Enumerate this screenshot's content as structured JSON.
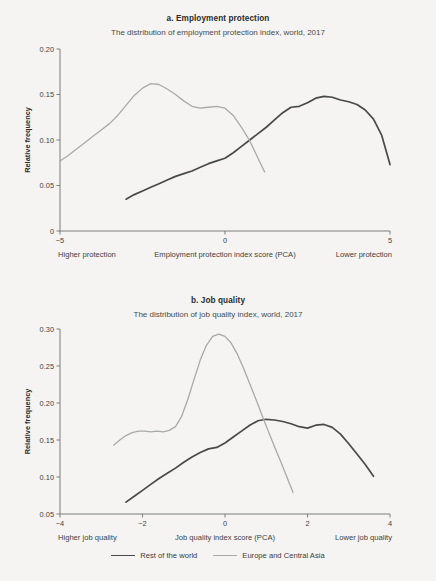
{
  "figure": {
    "background_color": "#f5f4f2",
    "series_colors": {
      "rest_of_the_world": "#494949",
      "europe_and_central_asia": "#a9a9a9"
    }
  },
  "legend": {
    "position": "bottom-center",
    "items": [
      {
        "label": "Rest of the world",
        "color": "#494949",
        "key": "rest_of_the_world"
      },
      {
        "label": "Europe and Central Asia",
        "color": "#a9a9a9",
        "key": "europe_and_central_asia"
      }
    ]
  },
  "chart_data": [
    {
      "id": "panel-a",
      "type": "line",
      "title": "a. Employment protection",
      "subtitle": "The distribution of employment protection index, world, 2017",
      "xlabel": "Employment protection index score (PCA)",
      "ylabel": "Relative frequency",
      "xlim": [
        -5,
        5
      ],
      "ylim": [
        0,
        0.2
      ],
      "xticks": [
        -5,
        0,
        5
      ],
      "xtick_labels": [
        "−5",
        "0",
        "5"
      ],
      "yticks": [
        0,
        0.05,
        0.1,
        0.15,
        0.2
      ],
      "ytick_labels": [
        "0",
        "0.05",
        "0.10",
        "0.15",
        "0.20"
      ],
      "grid": false,
      "left_note": "Higher protection",
      "right_note": "Lower protection",
      "series": [
        {
          "name": "Rest of the world",
          "color": "#494949",
          "x": [
            -3.0,
            -2.75,
            -2.5,
            -2.25,
            -2.0,
            -1.75,
            -1.5,
            -1.25,
            -1.0,
            -0.75,
            -0.5,
            -0.25,
            0.0,
            0.25,
            0.5,
            0.75,
            1.0,
            1.25,
            1.5,
            1.75,
            2.0,
            2.25,
            2.5,
            2.75,
            3.0,
            3.25,
            3.5,
            3.75,
            4.0,
            4.25,
            4.5,
            4.75,
            5.0
          ],
          "y": [
            0.035,
            0.04,
            0.044,
            0.048,
            0.052,
            0.056,
            0.06,
            0.063,
            0.066,
            0.07,
            0.074,
            0.077,
            0.08,
            0.086,
            0.093,
            0.1,
            0.107,
            0.114,
            0.122,
            0.13,
            0.136,
            0.137,
            0.141,
            0.146,
            0.148,
            0.147,
            0.144,
            0.142,
            0.139,
            0.133,
            0.123,
            0.105,
            0.073
          ]
        },
        {
          "name": "Europe and Central Asia",
          "color": "#a9a9a9",
          "x": [
            -5.0,
            -4.75,
            -4.5,
            -4.25,
            -4.0,
            -3.75,
            -3.5,
            -3.25,
            -3.0,
            -2.75,
            -2.5,
            -2.25,
            -2.0,
            -1.75,
            -1.5,
            -1.25,
            -1.0,
            -0.75,
            -0.5,
            -0.25,
            0.0,
            0.25,
            0.5,
            0.75,
            1.0,
            1.2
          ],
          "y": [
            0.077,
            0.083,
            0.09,
            0.097,
            0.104,
            0.111,
            0.118,
            0.127,
            0.138,
            0.149,
            0.157,
            0.162,
            0.161,
            0.156,
            0.15,
            0.143,
            0.137,
            0.135,
            0.136,
            0.137,
            0.135,
            0.127,
            0.114,
            0.099,
            0.08,
            0.065
          ]
        }
      ]
    },
    {
      "id": "panel-b",
      "type": "line",
      "title": "b. Job quality",
      "subtitle": "The distribution of job quality index, world, 2017",
      "xlabel": "Job quality index score (PCA)",
      "ylabel": "Relative frequency",
      "xlim": [
        -4,
        4
      ],
      "ylim": [
        0.05,
        0.3
      ],
      "xticks": [
        -4,
        -2,
        0,
        2,
        4
      ],
      "xtick_labels": [
        "−4",
        "−2",
        "0",
        "2",
        "4"
      ],
      "yticks": [
        0.05,
        0.1,
        0.15,
        0.2,
        0.25,
        0.3
      ],
      "ytick_labels": [
        "0.05",
        "0.10",
        "0.15",
        "0.20",
        "0.25",
        "0.30"
      ],
      "grid": false,
      "left_note": "Higher job quality",
      "right_note": "Lower job quality",
      "series": [
        {
          "name": "Rest of the world",
          "color": "#494949",
          "x": [
            -2.4,
            -2.2,
            -2.0,
            -1.8,
            -1.6,
            -1.4,
            -1.2,
            -1.0,
            -0.8,
            -0.6,
            -0.4,
            -0.2,
            0.0,
            0.2,
            0.4,
            0.6,
            0.8,
            1.0,
            1.2,
            1.4,
            1.6,
            1.8,
            2.0,
            2.2,
            2.4,
            2.6,
            2.8,
            3.0,
            3.2,
            3.4,
            3.6
          ],
          "y": [
            0.066,
            0.074,
            0.082,
            0.09,
            0.098,
            0.105,
            0.112,
            0.12,
            0.127,
            0.133,
            0.138,
            0.14,
            0.146,
            0.154,
            0.162,
            0.17,
            0.176,
            0.178,
            0.177,
            0.175,
            0.172,
            0.168,
            0.166,
            0.17,
            0.171,
            0.167,
            0.158,
            0.145,
            0.131,
            0.117,
            0.101
          ]
        },
        {
          "name": "Europe and Central Asia",
          "color": "#a9a9a9",
          "x": [
            -2.7,
            -2.55,
            -2.4,
            -2.25,
            -2.1,
            -1.95,
            -1.8,
            -1.65,
            -1.5,
            -1.35,
            -1.2,
            -1.05,
            -0.9,
            -0.75,
            -0.6,
            -0.45,
            -0.3,
            -0.15,
            0.0,
            0.15,
            0.3,
            0.45,
            0.6,
            0.75,
            0.9,
            1.05,
            1.2,
            1.35,
            1.5,
            1.65
          ],
          "y": [
            0.143,
            0.15,
            0.156,
            0.16,
            0.162,
            0.162,
            0.161,
            0.162,
            0.161,
            0.163,
            0.168,
            0.182,
            0.205,
            0.232,
            0.258,
            0.278,
            0.29,
            0.293,
            0.29,
            0.281,
            0.266,
            0.247,
            0.226,
            0.205,
            0.183,
            0.162,
            0.141,
            0.121,
            0.1,
            0.079
          ]
        }
      ]
    }
  ]
}
